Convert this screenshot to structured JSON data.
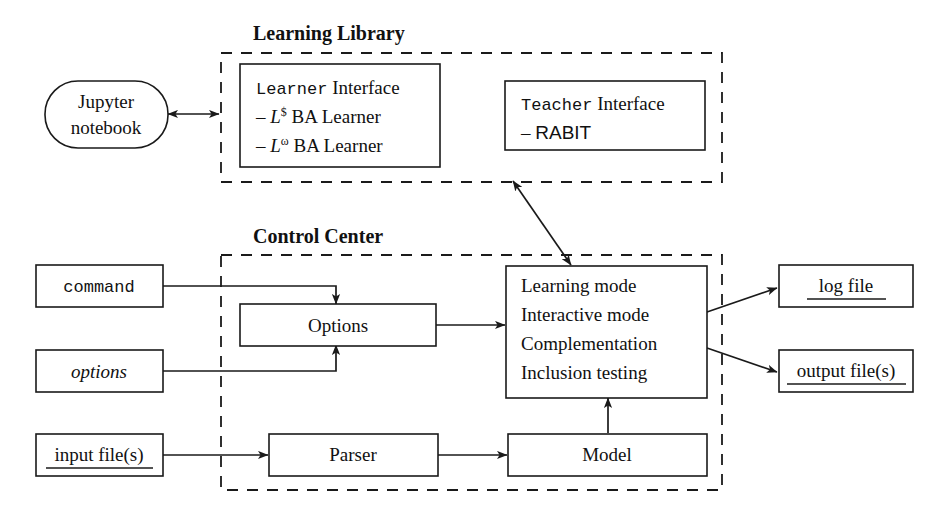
{
  "diagram": {
    "background": "#ffffff",
    "stroke_color": "#1a1a1a",
    "groups": [
      {
        "id": "learning-library",
        "label": "Learning Library"
      },
      {
        "id": "control-center",
        "label": "Control Center"
      }
    ],
    "nodes": {
      "jupyter": {
        "line1": "Jupyter",
        "line2": "notebook"
      },
      "learner_interface": {
        "title_mono": "Learner",
        "title_rest": " Interface",
        "items": [
          {
            "dash": "– ",
            "sym": "L",
            "sup": "$",
            "rest": " BA Learner"
          },
          {
            "dash": "– ",
            "sym": "L",
            "sup": "ω",
            "rest": " BA Learner"
          }
        ]
      },
      "teacher_interface": {
        "title_mono": "Teacher",
        "title_rest": " Interface",
        "items": [
          {
            "dash": "– ",
            "label": "RABIT"
          }
        ]
      },
      "command": {
        "label": "command"
      },
      "options_input": {
        "label": "options"
      },
      "input_files": {
        "label": "input file(s)"
      },
      "options_box": {
        "label": "Options"
      },
      "parser": {
        "label": "Parser"
      },
      "model": {
        "label": "Model"
      },
      "modes": {
        "lines": [
          "Learning mode",
          "Interactive mode",
          "Complementation",
          "Inclusion testing"
        ]
      },
      "log_file": {
        "label": "log file"
      },
      "output_files": {
        "label": "output file(s)"
      }
    }
  }
}
